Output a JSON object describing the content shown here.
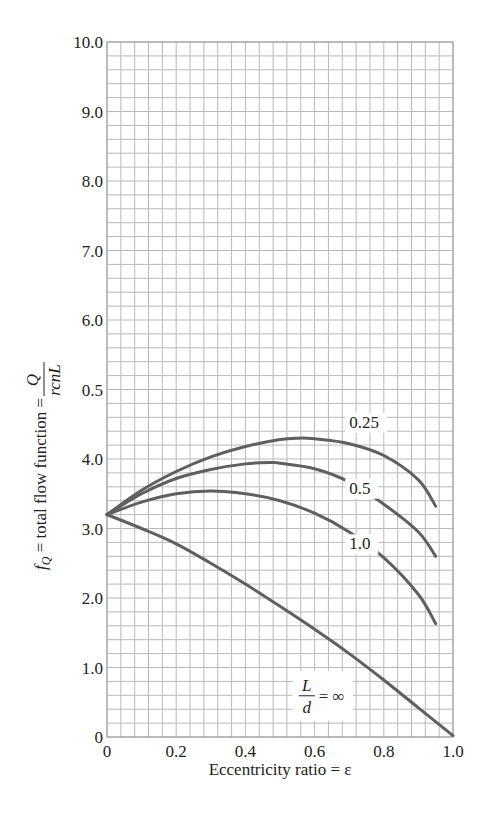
{
  "chart_data": {
    "type": "line",
    "title": "",
    "xlabel": "Eccentricity ratio = ε",
    "ylabel": "f_Q = total flow function = Q / (rcnL)",
    "ylabel_parts": {
      "prefix": "f",
      "subscript": "Q",
      "text": " = total flow function = ",
      "num": "Q",
      "den": "rcnL"
    },
    "xlim": [
      0,
      1.0
    ],
    "ylim": [
      0,
      10.0
    ],
    "x_ticks": [
      "0",
      "0.2",
      "0.4",
      "0.6",
      "0.8",
      "1.0"
    ],
    "x_tick_values": [
      0,
      0.2,
      0.4,
      0.6,
      0.8,
      1.0
    ],
    "y_ticks": [
      "0",
      "1.0",
      "2.0",
      "3.0",
      "4.0",
      "0.5",
      "6.0",
      "7.0",
      "8.0",
      "9.0",
      "10.0"
    ],
    "y_tick_values": [
      0,
      1,
      2,
      3,
      4,
      5,
      6,
      7,
      8,
      9,
      10
    ],
    "grid": {
      "on": true,
      "x_minor_step": 0.04,
      "y_minor_step": 0.2
    },
    "legend": "inline labels",
    "series": [
      {
        "name": "L/d = 0.25",
        "label": "0.25",
        "label_pos": [
          0.7,
          4.45
        ],
        "x": [
          0,
          0.1,
          0.2,
          0.3,
          0.4,
          0.5,
          0.55,
          0.6,
          0.7,
          0.8,
          0.9,
          0.95
        ],
        "y": [
          3.2,
          3.55,
          3.82,
          4.03,
          4.18,
          4.28,
          4.3,
          4.29,
          4.22,
          4.05,
          3.7,
          3.32
        ]
      },
      {
        "name": "L/d = 0.5",
        "label": "0.5",
        "label_pos": [
          0.7,
          3.5
        ],
        "x": [
          0,
          0.1,
          0.2,
          0.3,
          0.4,
          0.47,
          0.5,
          0.6,
          0.7,
          0.8,
          0.9,
          0.95
        ],
        "y": [
          3.2,
          3.5,
          3.72,
          3.85,
          3.93,
          3.95,
          3.94,
          3.86,
          3.67,
          3.35,
          2.95,
          2.6
        ]
      },
      {
        "name": "L/d = 1.0",
        "label": "1.0",
        "label_pos": [
          0.7,
          2.7
        ],
        "x": [
          0,
          0.1,
          0.2,
          0.3,
          0.4,
          0.5,
          0.6,
          0.7,
          0.8,
          0.9,
          0.95
        ],
        "y": [
          3.2,
          3.38,
          3.5,
          3.54,
          3.5,
          3.4,
          3.22,
          2.95,
          2.58,
          2.05,
          1.63
        ]
      },
      {
        "name": "L/d = ∞",
        "label": "L/d = ∞",
        "label_pos": [
          0.56,
          0.55
        ],
        "x": [
          0,
          0.1,
          0.2,
          0.3,
          0.4,
          0.5,
          0.6,
          0.7,
          0.8,
          0.9,
          1.0
        ],
        "y": [
          3.2,
          3.0,
          2.78,
          2.5,
          2.2,
          1.88,
          1.55,
          1.2,
          0.82,
          0.42,
          0.02
        ]
      }
    ],
    "colors": {
      "curve": "#5f5f5f",
      "grid": "#b9b9b9",
      "text": "#222222"
    }
  }
}
